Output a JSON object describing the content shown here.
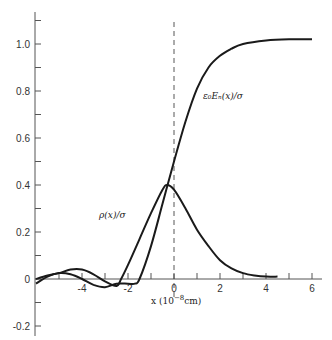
{
  "chart_data": {
    "type": "line",
    "title": "",
    "xlabel": "x (10^-8 cm)",
    "ylabel": "",
    "xlim": [
      -6,
      6
    ],
    "ylim": [
      -0.25,
      1.1
    ],
    "grid": false,
    "legend": "none (inline curve labels)",
    "x_ticks": [
      -4,
      -2,
      0,
      2,
      4,
      6
    ],
    "x_tick_labels": [
      "-4",
      "-2",
      "0",
      "2",
      "4",
      "6"
    ],
    "y_ticks": [
      -0.2,
      0,
      0.2,
      0.4,
      0.6,
      0.8,
      1.0
    ],
    "y_tick_labels": [
      "-0.2",
      "0",
      "0.2",
      "0.4",
      "0.6",
      "0.8",
      "1.0"
    ],
    "annotations": [
      {
        "text": "dashed vertical line at x = 0"
      },
      {
        "text": "ε₀Eₙ(x)/σ",
        "x": 1.3,
        "y": 0.7
      },
      {
        "text": "ρ(x)/σ",
        "x": -3.0,
        "y": 0.26
      }
    ],
    "series": [
      {
        "name": "ε₀Eₙ(x)/σ",
        "x": [
          -6.0,
          -5.5,
          -5.0,
          -4.5,
          -4.0,
          -3.5,
          -3.0,
          -2.5,
          -2.0,
          -1.7,
          -1.5,
          -1.0,
          -0.5,
          0.0,
          0.5,
          1.0,
          1.5,
          2.0,
          2.5,
          3.0,
          4.0,
          5.0,
          6.0
        ],
        "y": [
          -0.02,
          0.01,
          0.025,
          0.02,
          0.0,
          -0.025,
          -0.035,
          -0.02,
          -0.02,
          -0.02,
          0.0,
          0.14,
          0.32,
          0.5,
          0.67,
          0.81,
          0.9,
          0.95,
          0.98,
          1.0,
          1.015,
          1.02,
          1.02
        ]
      },
      {
        "name": "ρ(x)/σ",
        "x": [
          -6.0,
          -5.5,
          -5.0,
          -4.5,
          -4.0,
          -3.5,
          -3.0,
          -2.5,
          -2.3,
          -2.0,
          -1.5,
          -1.0,
          -0.5,
          -0.3,
          0.0,
          0.5,
          1.0,
          1.5,
          2.0,
          2.5,
          3.0,
          3.5,
          4.0,
          4.5
        ],
        "y": [
          0.0,
          0.015,
          0.025,
          0.04,
          0.04,
          0.02,
          -0.01,
          -0.03,
          0.0,
          0.06,
          0.17,
          0.28,
          0.38,
          0.4,
          0.38,
          0.3,
          0.21,
          0.14,
          0.08,
          0.045,
          0.025,
          0.015,
          0.01,
          0.01
        ]
      }
    ]
  },
  "labels": {
    "e_curve": "ε₀Eₙ(x)/σ",
    "rho_curve": "ρ(x)/σ",
    "x_axis": "x (10",
    "x_axis_exp": "−8",
    "x_axis_unit": "cm)"
  }
}
